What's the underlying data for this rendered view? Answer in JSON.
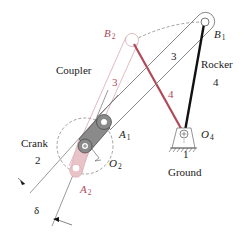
{
  "diagram": {
    "labels": {
      "coupler": "Coupler",
      "rocker": "Rocker",
      "rocker_num": "4",
      "crank": "Crank",
      "crank_num": "2",
      "ground_num": "1",
      "ground": "Ground",
      "link3_pos1": "3",
      "link3_pos2": "3",
      "link4_pos2": "4",
      "delta": "δ"
    },
    "points": {
      "B1": {
        "letter": "B",
        "sub": "1"
      },
      "B2": {
        "letter": "B",
        "sub": "2"
      },
      "A1": {
        "letter": "A",
        "sub": "1"
      },
      "A2": {
        "letter": "A",
        "sub": "2"
      },
      "O2": {
        "letter": "O",
        "sub": "2"
      },
      "O4": {
        "letter": "O",
        "sub": "4"
      }
    },
    "colors": {
      "primary": "#1a1a1a",
      "secondary": "#b04a5a",
      "secondary_light": "#e8c4c8",
      "crank_fill": "#8a8a8a",
      "outline": "#7a7a7a"
    }
  }
}
